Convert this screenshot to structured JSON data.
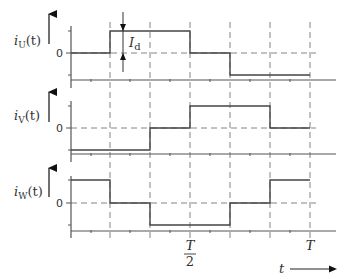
{
  "figure": {
    "plots": [
      {
        "id": "U",
        "ylabel": "i",
        "ylabel_sub": "U",
        "ylabel_suffix": "(t)",
        "zero_label": "0",
        "levels": [
          "0",
          "+Id",
          "+Id",
          "0",
          "-Id",
          "-Id"
        ],
        "annotation": {
          "label": "I",
          "label_sub": "d"
        }
      },
      {
        "id": "V",
        "ylabel": "i",
        "ylabel_sub": "V",
        "ylabel_suffix": "(t)",
        "zero_label": "0",
        "levels": [
          "-Id",
          "-Id",
          "0",
          "+Id",
          "+Id",
          "0"
        ]
      },
      {
        "id": "W",
        "ylabel": "i",
        "ylabel_sub": "W",
        "ylabel_suffix": "(t)",
        "zero_label": "0",
        "levels": [
          "+Id",
          "0",
          "-Id",
          "-Id",
          "0",
          "+Id"
        ]
      }
    ],
    "x_ticks": [
      {
        "label_num": "T",
        "label_den": "2",
        "position": "T/2"
      },
      {
        "label": "T",
        "position": "T"
      }
    ],
    "x_axis_label": "t",
    "segments_per_period": 6
  }
}
